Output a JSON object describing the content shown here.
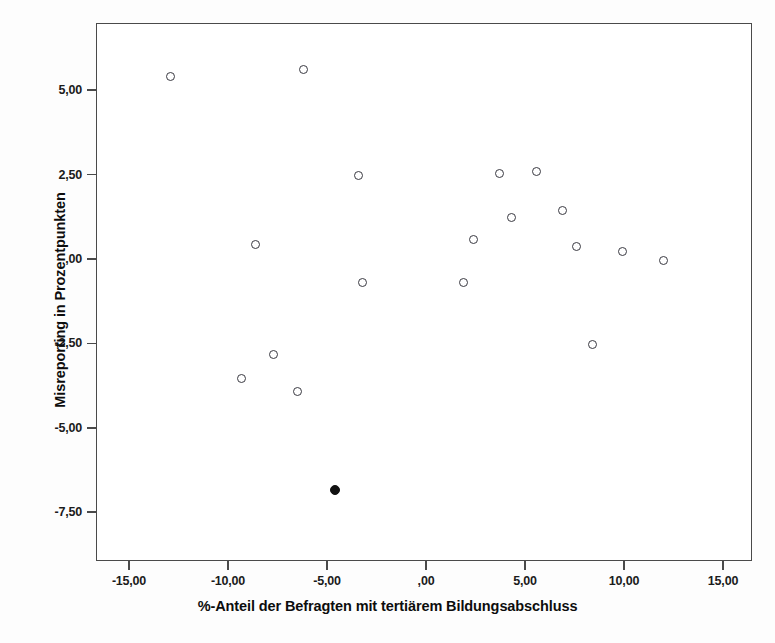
{
  "chart_data": {
    "type": "scatter",
    "title": "",
    "xlabel": "%-Anteil der Befragten mit tertiärem Bildungsabschluss",
    "ylabel": "Misreporting in Prozentpunkten",
    "xlim": [
      -16.6,
      16.5
    ],
    "ylim": [
      -9.0,
      6.9
    ],
    "grid": false,
    "legend": "none",
    "xticks": [
      -15,
      -10,
      -5,
      0,
      5,
      10,
      15
    ],
    "xticklabels": [
      "-15,00",
      "-10,00",
      "-5,00",
      ",00",
      "5,00",
      "10,00",
      "15,00"
    ],
    "yticks": [
      5,
      2.5,
      0,
      -2.5,
      -5,
      -7.5
    ],
    "yticklabels": [
      "5,00",
      "2,50",
      ",00",
      "-2,50",
      "-5,00",
      "-7,50"
    ],
    "decimal_separator": ",",
    "series": [
      {
        "name": "open-markers",
        "marker": "open-circle",
        "color": "#3a3a42",
        "points": [
          {
            "x": -12.9,
            "y": 5.4
          },
          {
            "x": -6.2,
            "y": 5.6
          },
          {
            "x": -3.4,
            "y": 2.48
          },
          {
            "x": -8.6,
            "y": 0.42
          },
          {
            "x": -3.2,
            "y": -0.7
          },
          {
            "x": -7.7,
            "y": -2.82
          },
          {
            "x": -9.3,
            "y": -3.55
          },
          {
            "x": -6.5,
            "y": -3.92
          },
          {
            "x": 1.9,
            "y": -0.7
          },
          {
            "x": 2.4,
            "y": 0.58
          },
          {
            "x": 3.7,
            "y": 2.52
          },
          {
            "x": 4.3,
            "y": 1.22
          },
          {
            "x": 5.6,
            "y": 2.58
          },
          {
            "x": 6.9,
            "y": 1.45
          },
          {
            "x": 7.6,
            "y": 0.38
          },
          {
            "x": 8.4,
            "y": -2.52
          },
          {
            "x": 9.9,
            "y": 0.22
          },
          {
            "x": 12.0,
            "y": -0.05
          }
        ]
      },
      {
        "name": "filled-marker",
        "marker": "filled-circle",
        "color": "#111111",
        "points": [
          {
            "x": -4.6,
            "y": -6.85
          }
        ]
      }
    ]
  },
  "figure": {
    "axis_color": "#4a4a4a",
    "background": "#ffffff",
    "n_points": 19
  }
}
